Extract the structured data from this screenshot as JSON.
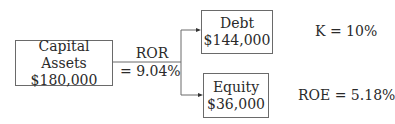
{
  "diagram": {
    "capital": {
      "title": "Capital Assets",
      "value": "$180,000"
    },
    "ror": {
      "label": "ROR",
      "value": "= 9.04%"
    },
    "debt": {
      "title": "Debt",
      "value": "$144,000",
      "rate": "K = 10%"
    },
    "equity": {
      "title": "Equity",
      "value": "$36,000",
      "rate": "ROE = 5.18%"
    }
  }
}
